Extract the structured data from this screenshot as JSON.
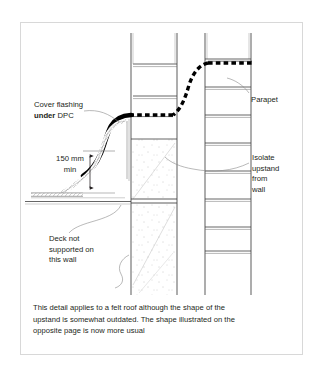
{
  "figure": {
    "type": "construction-detail-drawing",
    "annotations": {
      "cover_flashing": {
        "line1": "Cover flashing",
        "line2_bold": "under",
        "line2_rest": " DPC"
      },
      "dimension": {
        "line1": "150 mm",
        "line2": "min",
        "value": 150,
        "unit": "mm",
        "qualifier": "min"
      },
      "deck": {
        "line1": "Deck not",
        "line2": "supported on",
        "line3": "this wall"
      },
      "parapet": {
        "label": "Parapet"
      },
      "isolate": {
        "line1": "Isolate",
        "line2": "upstand",
        "line3": "from",
        "line4": "wall"
      }
    },
    "caption": {
      "line1": "This detail applies to a felt roof although the shape of the",
      "line2": "upstand is somewhat outdated. The shape illustrated on the",
      "line3": "opposite page is now more usual"
    },
    "colors": {
      "border": "#d8d8d8",
      "ink": "#231f20",
      "line": "#3f3f3f",
      "hairline": "#8a8a8a",
      "flashing": "#000000",
      "dpc": "#000000",
      "background": "#ffffff"
    }
  }
}
